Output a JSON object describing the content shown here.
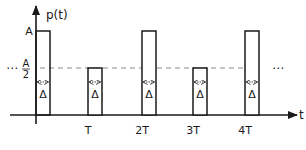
{
  "diagram": {
    "y_axis_label": "p(t)",
    "x_axis_label": "t",
    "level_high_label": "A",
    "level_half_label_num": "A",
    "level_half_label_den": "2",
    "ellipsis_left": "⋯",
    "ellipsis_right": "⋯",
    "width_label": "Δ",
    "ticks": [
      "T",
      "2T",
      "3T",
      "4T"
    ],
    "pulses": [
      {
        "position": "0",
        "height": "A"
      },
      {
        "position": "T",
        "height": "A/2"
      },
      {
        "position": "2T",
        "height": "A"
      },
      {
        "position": "3T",
        "height": "A/2"
      },
      {
        "position": "4T",
        "height": "A"
      }
    ],
    "pulse_width": "Δ",
    "colors": {
      "stroke": "#1a1a1a",
      "dashed": "#8a8a8a",
      "background": "#ffffff"
    }
  }
}
